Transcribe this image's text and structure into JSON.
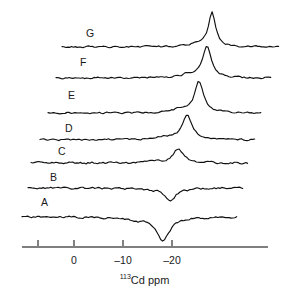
{
  "figure": {
    "kind": "nmr-stacked-spectra",
    "background_color": "#ffffff",
    "trace_color": "#111111",
    "axis_color": "#7f7f7f",
    "tick_color": "#4d4d4d",
    "width": 289,
    "height": 296
  },
  "axis": {
    "title_isotope": "113",
    "title_element": "Cd ppm",
    "title_full": "113Cd ppm",
    "ticks": [
      {
        "value": 10,
        "label": "",
        "x": 38
      },
      {
        "value": 0,
        "label": "0",
        "x": 74
      },
      {
        "value": -10,
        "label": "-10",
        "x": 123
      },
      {
        "value": -20,
        "label": "-20",
        "x": 172
      }
    ],
    "axis_y": 247,
    "axis_x_start": 22,
    "axis_x_end": 268,
    "ppm_per_pixel": -0.205,
    "x_at_zero_ppm": 74
  },
  "labels": [
    {
      "id": "A",
      "text": "A",
      "x": 41,
      "y": 197
    },
    {
      "id": "B",
      "text": "B",
      "x": 50,
      "y": 172
    },
    {
      "id": "C",
      "text": "C",
      "x": 58,
      "y": 146
    },
    {
      "id": "D",
      "text": "D",
      "x": 65,
      "y": 123
    },
    {
      "id": "E",
      "text": "E",
      "x": 68,
      "y": 90
    },
    {
      "id": "F",
      "text": "F",
      "x": 80,
      "y": 57
    },
    {
      "id": "G",
      "text": "G",
      "x": 86,
      "y": 28
    }
  ],
  "chart_data": {
    "type": "line",
    "title": "",
    "subtitle": "",
    "xlabel": "113Cd ppm",
    "ylabel": "",
    "xlim": [
      13,
      -40
    ],
    "grid": false,
    "legend": "none",
    "stacked_offset": true,
    "tick_labels": [
      "",
      "0",
      "-10",
      "-20"
    ],
    "tick_values": [
      10,
      0,
      -10,
      -20
    ],
    "series": [
      {
        "name": "A",
        "label": "A",
        "baseline_y": 217,
        "x_start": 22,
        "x_end": 237,
        "peak_sign": "negative",
        "peak_ppm": -17.6,
        "peak_x": 163,
        "peak_amplitude_px": -24,
        "peak_width_px": 9,
        "noise_amplitude_px": 1.6,
        "noise_seed": 11
      },
      {
        "name": "B",
        "label": "B",
        "baseline_y": 188,
        "x_start": 28,
        "x_end": 243,
        "peak_sign": "negative",
        "peak_ppm": -19.0,
        "peak_x": 170,
        "peak_amplitude_px": -12,
        "peak_width_px": 8,
        "noise_amplitude_px": 1.6,
        "noise_seed": 23
      },
      {
        "name": "C",
        "label": "C",
        "baseline_y": 163,
        "x_start": 31,
        "x_end": 248,
        "peak_sign": "positive",
        "peak_ppm": -20.5,
        "peak_x": 178,
        "peak_amplitude_px": 14,
        "peak_width_px": 7,
        "noise_amplitude_px": 1.6,
        "noise_seed": 37
      },
      {
        "name": "D",
        "label": "D",
        "baseline_y": 140,
        "x_start": 40,
        "x_end": 256,
        "peak_sign": "positive",
        "peak_ppm": -22.2,
        "peak_x": 187,
        "peak_amplitude_px": 25,
        "peak_width_px": 7,
        "noise_amplitude_px": 1.5,
        "noise_seed": 53
      },
      {
        "name": "E",
        "label": "E",
        "baseline_y": 113,
        "x_start": 48,
        "x_end": 262,
        "peak_sign": "positive",
        "peak_ppm": -24.6,
        "peak_x": 199,
        "peak_amplitude_px": 32,
        "peak_width_px": 6,
        "noise_amplitude_px": 1.4,
        "noise_seed": 71
      },
      {
        "name": "F",
        "label": "F",
        "baseline_y": 78,
        "x_start": 56,
        "x_end": 272,
        "peak_sign": "positive",
        "peak_ppm": -26.2,
        "peak_x": 207,
        "peak_amplitude_px": 32,
        "peak_width_px": 6,
        "noise_amplitude_px": 1.4,
        "noise_seed": 89
      },
      {
        "name": "G",
        "label": "G",
        "baseline_y": 47,
        "x_start": 62,
        "x_end": 280,
        "peak_sign": "positive",
        "peak_ppm": -27.2,
        "peak_x": 212,
        "peak_amplitude_px": 35,
        "peak_width_px": 5,
        "noise_amplitude_px": 1.3,
        "noise_seed": 101
      }
    ]
  }
}
